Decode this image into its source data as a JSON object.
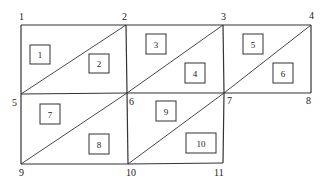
{
  "diagram": {
    "type": "finite-element-mesh",
    "nodes": [
      {
        "id": "1",
        "x": 21,
        "y": 25,
        "label_x": 19,
        "label_y": 20
      },
      {
        "id": "2",
        "x": 126,
        "y": 25,
        "label_x": 122,
        "label_y": 20
      },
      {
        "id": "3",
        "x": 223,
        "y": 25,
        "label_x": 221,
        "label_y": 20
      },
      {
        "id": "4",
        "x": 311,
        "y": 25,
        "label_x": 309,
        "label_y": 19
      },
      {
        "id": "5",
        "x": 21,
        "y": 94,
        "label_x": 12,
        "label_y": 106
      },
      {
        "id": "6",
        "x": 127,
        "y": 93,
        "label_x": 129,
        "label_y": 105
      },
      {
        "id": "7",
        "x": 224,
        "y": 93,
        "label_x": 227,
        "label_y": 104
      },
      {
        "id": "8",
        "x": 311,
        "y": 93,
        "label_x": 306,
        "label_y": 104
      },
      {
        "id": "9",
        "x": 21,
        "y": 164,
        "label_x": 19,
        "label_y": 176
      },
      {
        "id": "10",
        "x": 128,
        "y": 164,
        "label_x": 126,
        "label_y": 176
      },
      {
        "id": "11",
        "x": 223,
        "y": 163,
        "label_x": 214,
        "label_y": 176
      }
    ],
    "edges": [
      [
        "1",
        "2"
      ],
      [
        "2",
        "3"
      ],
      [
        "3",
        "4"
      ],
      [
        "5",
        "6"
      ],
      [
        "6",
        "7"
      ],
      [
        "7",
        "8"
      ],
      [
        "9",
        "10"
      ],
      [
        "10",
        "11"
      ],
      [
        "1",
        "5"
      ],
      [
        "5",
        "9"
      ],
      [
        "2",
        "6"
      ],
      [
        "6",
        "10"
      ],
      [
        "3",
        "7"
      ],
      [
        "7",
        "11"
      ],
      [
        "4",
        "8"
      ]
    ],
    "diagonals": [
      [
        "5",
        "2"
      ],
      [
        "6",
        "3"
      ],
      [
        "7",
        "4"
      ],
      [
        "9",
        "6"
      ],
      [
        "10",
        "7"
      ]
    ],
    "elements": [
      {
        "id": "1",
        "x": 30,
        "y": 45,
        "w": 20,
        "h": 19
      },
      {
        "id": "2",
        "x": 89,
        "y": 54,
        "w": 20,
        "h": 19
      },
      {
        "id": "3",
        "x": 146,
        "y": 34,
        "w": 20,
        "h": 20
      },
      {
        "id": "4",
        "x": 185,
        "y": 63,
        "w": 20,
        "h": 20
      },
      {
        "id": "5",
        "x": 243,
        "y": 34,
        "w": 20,
        "h": 20
      },
      {
        "id": "6",
        "x": 273,
        "y": 63,
        "w": 20,
        "h": 20
      },
      {
        "id": "7",
        "x": 40,
        "y": 104,
        "w": 20,
        "h": 20
      },
      {
        "id": "8",
        "x": 89,
        "y": 134,
        "w": 20,
        "h": 20
      },
      {
        "id": "9",
        "x": 156,
        "y": 101,
        "w": 20,
        "h": 20
      },
      {
        "id": "10",
        "x": 186,
        "y": 133,
        "w": 30,
        "h": 20
      }
    ]
  }
}
